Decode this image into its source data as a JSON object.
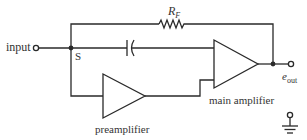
{
  "diagram": {
    "type": "circuit-schematic",
    "labels": {
      "input": "input",
      "summing_node": "S",
      "feedback_resistor": "R",
      "feedback_resistor_sub": "F",
      "output": "e",
      "output_sub": "out",
      "main_amplifier": "main amplifier",
      "preamplifier": "preamplifier"
    },
    "components": [
      {
        "id": "input-terminal",
        "kind": "terminal"
      },
      {
        "id": "summing-node",
        "kind": "junction",
        "label": "S"
      },
      {
        "id": "feedback-resistor",
        "kind": "resistor",
        "label": "RF"
      },
      {
        "id": "capacitor",
        "kind": "capacitor"
      },
      {
        "id": "preamplifier",
        "kind": "amplifier",
        "label": "preamplifier"
      },
      {
        "id": "main-amplifier",
        "kind": "amplifier",
        "label": "main amplifier"
      },
      {
        "id": "output-node",
        "kind": "junction"
      },
      {
        "id": "output-terminal",
        "kind": "terminal",
        "label": "eout"
      },
      {
        "id": "ground",
        "kind": "ground"
      }
    ],
    "colors": {
      "line": "#2a2a2a",
      "text": "#333333",
      "background": "#ffffff"
    }
  }
}
